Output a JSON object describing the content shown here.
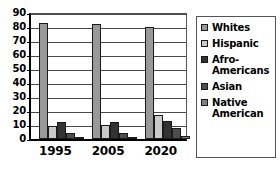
{
  "chart_data": {
    "type": "bar",
    "title": "",
    "xlabel": "",
    "ylabel": "",
    "ylim": [
      0,
      90
    ],
    "y_ticks": [
      90,
      80,
      70,
      60,
      50,
      40,
      30,
      20,
      10,
      0
    ],
    "grid": true,
    "legend_position": "right",
    "categories": [
      "1995",
      "2005",
      "2020"
    ],
    "series": [
      {
        "name": "Whites",
        "values": [
          83,
          82,
          80
        ],
        "color": "#999999"
      },
      {
        "name": "Hispanic",
        "values": [
          9,
          10,
          17
        ],
        "color": "#c9c9c9"
      },
      {
        "name": "Afro-Americans",
        "values": [
          12,
          12,
          13
        ],
        "color": "#333333"
      },
      {
        "name": "Asian",
        "values": [
          4,
          4,
          8
        ],
        "color": "#4d4d4d"
      },
      {
        "name": "Native American",
        "values": [
          1,
          1,
          2
        ],
        "color": "#808080"
      }
    ]
  },
  "legend": {
    "items": [
      {
        "label": "Whites"
      },
      {
        "label": "Hispanic"
      },
      {
        "label": "Afro-Americans"
      },
      {
        "label": "Asian"
      },
      {
        "label": "Native American"
      }
    ]
  }
}
